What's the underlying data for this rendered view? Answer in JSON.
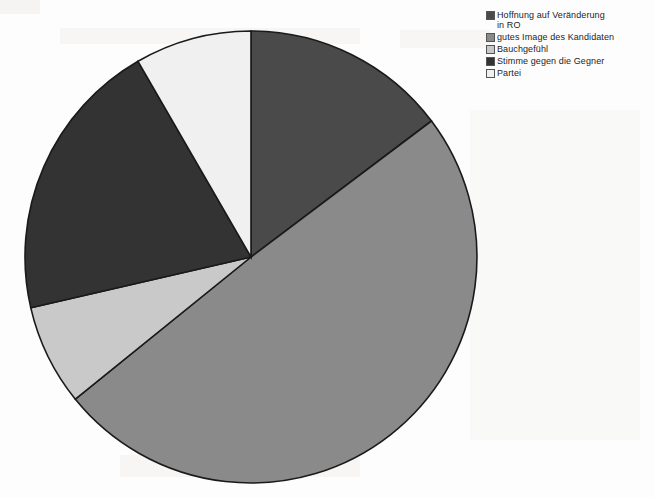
{
  "figure": {
    "caption_fragment": "",
    "background_color": "#fdfdfd"
  },
  "legend": {
    "position": "top-right",
    "items": [
      {
        "label": "Hoffnung auf Veränderung\nin RO",
        "color": "#4a4a4a",
        "swatch_name": "legend-swatch-hoffnung"
      },
      {
        "label": "gutes Image des Kandidaten",
        "color": "#8a8a8a",
        "swatch_name": "legend-swatch-image"
      },
      {
        "label": "Bauchgefühl",
        "color": "#c9c9c9",
        "swatch_name": "legend-swatch-bauchgefuehl"
      },
      {
        "label": "Stimme gegen die Gegner",
        "color": "#333333",
        "swatch_name": "legend-swatch-stimme"
      },
      {
        "label": "Partei",
        "color": "#f0f0f0",
        "swatch_name": "legend-swatch-partei"
      }
    ]
  },
  "chart_data": {
    "type": "pie",
    "title": "",
    "labels": [
      "Hoffnung auf Veränderung in RO",
      "gutes Image des Kandidaten",
      "Bauchgefühl",
      "Stimme gegen die Gegner",
      "Partei"
    ],
    "values": [
      14.7,
      49.4,
      7.2,
      20.3,
      8.3
    ],
    "units": "percent",
    "angles_deg": [
      53,
      178,
      26,
      73,
      30
    ],
    "colors": [
      "#4a4a4a",
      "#8a8a8a",
      "#c9c9c9",
      "#333333",
      "#f0f0f0"
    ],
    "start_angle_deg": 0,
    "direction": "clockwise",
    "center": [
      228,
      228
    ],
    "radius": 226,
    "stroke_color": "#1a1a1a",
    "legend_position": "right",
    "grid": false,
    "data_labels": false
  }
}
